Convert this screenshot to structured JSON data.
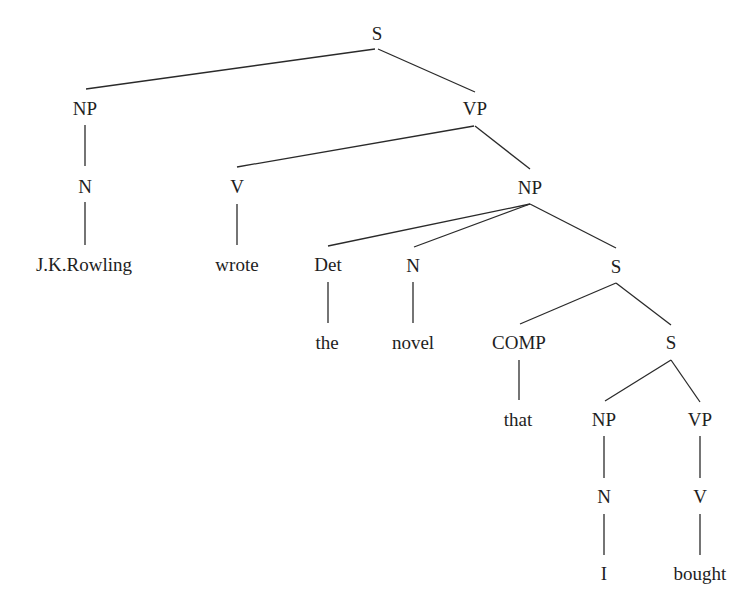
{
  "diagram": {
    "type": "syntax-tree",
    "nodes": [
      {
        "id": "s_root",
        "label": "S",
        "x": 377,
        "y": 33
      },
      {
        "id": "np_subj",
        "label": "NP",
        "x": 85,
        "y": 108
      },
      {
        "id": "vp_main",
        "label": "VP",
        "x": 475,
        "y": 108
      },
      {
        "id": "n_subj",
        "label": "N",
        "x": 85,
        "y": 186
      },
      {
        "id": "v_main",
        "label": "V",
        "x": 237,
        "y": 186
      },
      {
        "id": "np_obj",
        "label": "NP",
        "x": 530,
        "y": 187
      },
      {
        "id": "word_rowling",
        "label": "J.K.Rowling",
        "x": 84,
        "y": 264
      },
      {
        "id": "word_wrote",
        "label": "wrote",
        "x": 237,
        "y": 264
      },
      {
        "id": "det",
        "label": "Det",
        "x": 328,
        "y": 264
      },
      {
        "id": "n_obj",
        "label": "N",
        "x": 413,
        "y": 265
      },
      {
        "id": "s_rel",
        "label": "S",
        "x": 616,
        "y": 266
      },
      {
        "id": "word_the",
        "label": "the",
        "x": 327,
        "y": 342
      },
      {
        "id": "word_novel",
        "label": "novel",
        "x": 413,
        "y": 342
      },
      {
        "id": "comp",
        "label": "COMP",
        "x": 519,
        "y": 342
      },
      {
        "id": "s_inner",
        "label": "S",
        "x": 671,
        "y": 342
      },
      {
        "id": "word_that",
        "label": "that",
        "x": 518,
        "y": 419
      },
      {
        "id": "np_inner",
        "label": "NP",
        "x": 604,
        "y": 419
      },
      {
        "id": "vp_inner",
        "label": "VP",
        "x": 700,
        "y": 419
      },
      {
        "id": "n_inner",
        "label": "N",
        "x": 604,
        "y": 496
      },
      {
        "id": "v_inner",
        "label": "V",
        "x": 700,
        "y": 496
      },
      {
        "id": "word_i",
        "label": "I",
        "x": 604,
        "y": 573
      },
      {
        "id": "word_bought",
        "label": "bought",
        "x": 700,
        "y": 573
      }
    ],
    "edges": [
      {
        "from": "s_root",
        "to": "np_subj",
        "x1": 375,
        "y1": 49,
        "x2": 86,
        "y2": 89
      },
      {
        "from": "s_root",
        "to": "vp_main",
        "x1": 378,
        "y1": 49,
        "x2": 475,
        "y2": 92
      },
      {
        "from": "np_subj",
        "to": "n_subj",
        "x1": 85,
        "y1": 125,
        "x2": 85,
        "y2": 166
      },
      {
        "from": "vp_main",
        "to": "v_main",
        "x1": 474,
        "y1": 126,
        "x2": 237,
        "y2": 167
      },
      {
        "from": "vp_main",
        "to": "np_obj",
        "x1": 475,
        "y1": 126,
        "x2": 530,
        "y2": 169
      },
      {
        "from": "n_subj",
        "to": "word_rowling",
        "x1": 85,
        "y1": 202,
        "x2": 85,
        "y2": 245
      },
      {
        "from": "v_main",
        "to": "word_wrote",
        "x1": 237,
        "y1": 204,
        "x2": 237,
        "y2": 245
      },
      {
        "from": "np_obj",
        "to": "det",
        "x1": 530,
        "y1": 204,
        "x2": 328,
        "y2": 246
      },
      {
        "from": "np_obj",
        "to": "n_obj",
        "x1": 530,
        "y1": 204,
        "x2": 414,
        "y2": 247
      },
      {
        "from": "np_obj",
        "to": "s_rel",
        "x1": 530,
        "y1": 204,
        "x2": 616,
        "y2": 248
      },
      {
        "from": "det",
        "to": "word_the",
        "x1": 328,
        "y1": 282,
        "x2": 328,
        "y2": 323
      },
      {
        "from": "n_obj",
        "to": "word_novel",
        "x1": 413,
        "y1": 282,
        "x2": 413,
        "y2": 323
      },
      {
        "from": "s_rel",
        "to": "comp",
        "x1": 616,
        "y1": 283,
        "x2": 520,
        "y2": 324
      },
      {
        "from": "s_rel",
        "to": "s_inner",
        "x1": 616,
        "y1": 283,
        "x2": 671,
        "y2": 325
      },
      {
        "from": "comp",
        "to": "word_that",
        "x1": 519,
        "y1": 360,
        "x2": 519,
        "y2": 400
      },
      {
        "from": "s_inner",
        "to": "np_inner",
        "x1": 671,
        "y1": 360,
        "x2": 605,
        "y2": 401
      },
      {
        "from": "s_inner",
        "to": "vp_inner",
        "x1": 671,
        "y1": 360,
        "x2": 700,
        "y2": 402
      },
      {
        "from": "np_inner",
        "to": "n_inner",
        "x1": 604,
        "y1": 436,
        "x2": 604,
        "y2": 478
      },
      {
        "from": "vp_inner",
        "to": "v_inner",
        "x1": 700,
        "y1": 436,
        "x2": 700,
        "y2": 478
      },
      {
        "from": "n_inner",
        "to": "word_i",
        "x1": 604,
        "y1": 514,
        "x2": 604,
        "y2": 555
      },
      {
        "from": "v_inner",
        "to": "word_bought",
        "x1": 700,
        "y1": 514,
        "x2": 700,
        "y2": 555
      }
    ],
    "sentence": "J.K.Rowling wrote the novel that I bought"
  }
}
